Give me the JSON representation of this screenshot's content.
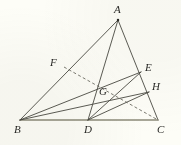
{
  "figure": {
    "type": "euclidean-geometry-diagram",
    "background_color": "#fdfdf7",
    "stroke_color": "#4a4a42",
    "baseline_color": "#8c8a7a",
    "label_color": "#2b2b28",
    "width": 181,
    "height": 145
  },
  "points": {
    "A": {
      "label": "A",
      "x": 118,
      "y": 20,
      "label_x": 114,
      "label_y": 4,
      "marked": true
    },
    "B": {
      "label": "B",
      "x": 20,
      "y": 120,
      "label_x": 14,
      "label_y": 124,
      "marked": false
    },
    "C": {
      "label": "C",
      "x": 158,
      "y": 120,
      "label_x": 157,
      "label_y": 124,
      "marked": false
    },
    "D": {
      "label": "D",
      "x": 88,
      "y": 120,
      "label_x": 84,
      "label_y": 124,
      "marked": false
    },
    "E": {
      "label": "E",
      "x": 141,
      "y": 72,
      "label_x": 145,
      "label_y": 62,
      "marked": false
    },
    "F": {
      "label": "F",
      "x": 64,
      "y": 67,
      "label_x": 50,
      "label_y": 57,
      "marked": false
    },
    "G": {
      "label": "G",
      "x": 102,
      "y": 82,
      "label_x": 99,
      "label_y": 86,
      "marked": false
    },
    "H": {
      "label": "H",
      "x": 149,
      "y": 92,
      "label_x": 152,
      "label_y": 81,
      "marked": false
    }
  },
  "segments": [
    {
      "name": "side-AB",
      "from": "A",
      "to": "B",
      "style": "solid"
    },
    {
      "name": "side-AC",
      "from": "A",
      "to": "C",
      "style": "solid"
    },
    {
      "name": "side-BC",
      "from": "B",
      "to": "C",
      "style": "solid-base"
    },
    {
      "name": "cevian-AD",
      "from": "A",
      "to": "D",
      "style": "solid"
    },
    {
      "name": "cevian-BE",
      "from": "B",
      "to": "E",
      "style": "solid"
    },
    {
      "name": "cevian-BH",
      "from": "B",
      "to": "H",
      "style": "solid"
    },
    {
      "name": "segment-DE",
      "from": "D",
      "to": "E",
      "style": "solid"
    },
    {
      "name": "segment-DH",
      "from": "D",
      "to": "H",
      "style": "solid"
    },
    {
      "name": "cevian-FC",
      "from": "F",
      "to": "C",
      "style": "dashed"
    },
    {
      "name": "segment-FD-dashed",
      "from": "F",
      "to": "D",
      "style": "none"
    }
  ],
  "intersection": {
    "name": "G",
    "description": "intersection of cevians"
  }
}
